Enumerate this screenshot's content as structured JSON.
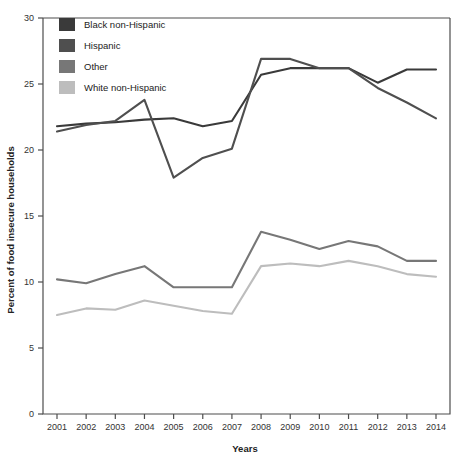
{
  "chart_data": {
    "type": "line",
    "title": "",
    "xlabel": "Years",
    "ylabel": "Percent of food insecure households",
    "categories": [
      "2001",
      "2002",
      "2003",
      "2004",
      "2005",
      "2006",
      "2007",
      "2008",
      "2009",
      "2010",
      "2011",
      "2012",
      "2013",
      "2014"
    ],
    "x": [
      2001,
      2002,
      2003,
      2004,
      2005,
      2006,
      2007,
      2008,
      2009,
      2010,
      2011,
      2012,
      2013,
      2014
    ],
    "xlim": [
      2000.5,
      2014.5
    ],
    "ylim": [
      0,
      30
    ],
    "yticks": [
      0,
      5,
      10,
      15,
      20,
      25,
      30
    ],
    "xticks": [
      "2001",
      "2002",
      "2003",
      "2004",
      "2005",
      "2006",
      "2007",
      "2008",
      "2009",
      "2010",
      "2011",
      "2012",
      "2013",
      "2014"
    ],
    "grid": false,
    "legend_position": "top-left",
    "series": [
      {
        "name": "Black non-Hispanic",
        "color": "#3a3a3a",
        "values": [
          21.8,
          22.0,
          22.1,
          22.3,
          22.4,
          21.8,
          22.2,
          25.7,
          26.2,
          26.2,
          26.2,
          25.1,
          26.1,
          26.1
        ]
      },
      {
        "name": "Hispanic",
        "color": "#4f4f4f",
        "values": [
          21.4,
          21.9,
          22.2,
          23.8,
          17.9,
          19.4,
          20.1,
          26.9,
          26.9,
          26.2,
          26.2,
          24.7,
          23.6,
          22.4
        ]
      },
      {
        "name": "Other",
        "color": "#777777",
        "values": [
          10.2,
          9.9,
          10.6,
          11.2,
          9.6,
          9.6,
          9.6,
          13.8,
          13.2,
          12.5,
          13.1,
          12.7,
          11.6,
          11.6
        ]
      },
      {
        "name": "White non-Hispanic",
        "color": "#bdbdbd",
        "values": [
          7.5,
          8.0,
          7.9,
          8.6,
          8.2,
          7.8,
          7.6,
          11.2,
          11.4,
          11.2,
          11.6,
          11.2,
          10.6,
          10.4
        ]
      }
    ],
    "legend": [
      {
        "label": "Black non-Hispanic",
        "color": "#3a3a3a"
      },
      {
        "label": "Hispanic",
        "color": "#4f4f4f"
      },
      {
        "label": "Other",
        "color": "#777777"
      },
      {
        "label": "White non-Hispanic",
        "color": "#bdbdbd"
      }
    ]
  }
}
